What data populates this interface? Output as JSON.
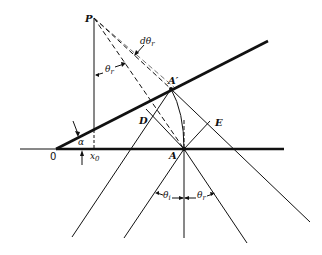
{
  "figure": {
    "type": "geometric optics diagram - reflection from inclined surface",
    "points": {
      "P": {
        "label": "P",
        "x": 94,
        "y": 18
      },
      "A_prime": {
        "label": "A′",
        "x": 171,
        "y": 89
      },
      "A": {
        "label": "A",
        "x": 184,
        "y": 149
      },
      "D": {
        "label": "D",
        "x": 146,
        "y": 109
      },
      "E": {
        "label": "E",
        "x": 210,
        "y": 121
      },
      "O": {
        "label": "0",
        "x": 56,
        "y": 149
      }
    },
    "labels": {
      "P": "P",
      "A_prime": "A′",
      "A": "A",
      "D": "D",
      "E": "E",
      "origin": "0",
      "alpha": "α",
      "x0": "x",
      "x0_sub": "0",
      "d_theta_r": "dθ",
      "d_theta_r_sub": "r",
      "theta_r_top": "θ",
      "theta_r_top_sub": "r",
      "theta_i": "θ",
      "theta_i_sub": "i",
      "theta_r_bottom": "θ",
      "theta_r_bottom_sub": "r"
    },
    "colors": {
      "line": "#111111",
      "background": "#ffffff"
    }
  }
}
